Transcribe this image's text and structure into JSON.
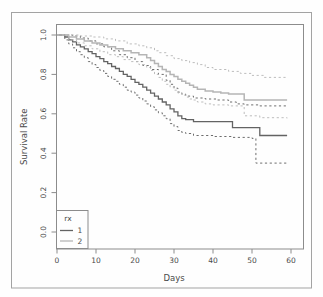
{
  "figure": {
    "border_color": "#a3a3a3",
    "panel_border_color": "#8c8c8c",
    "background": "#fefefe"
  },
  "chart_data": {
    "type": "line",
    "subtype": "kaplan-meier-step-survival",
    "title": "",
    "xlabel": "Days",
    "ylabel": "Survival Rate",
    "xlim": [
      0,
      60
    ],
    "ylim": [
      0.0,
      1.0
    ],
    "x_ticks": [
      0,
      10,
      20,
      30,
      40,
      50,
      60
    ],
    "y_ticks": [
      "0.0",
      "0.2",
      "0.4",
      "0.6",
      "0.8",
      "1.0"
    ],
    "grid": false,
    "legend": {
      "title": "rx",
      "position": "bottom-left",
      "entries": [
        {
          "label": "1",
          "color": "#636363"
        },
        {
          "label": "2",
          "color": "#b5b5b5"
        }
      ]
    },
    "series": [
      {
        "name": "rx=1 estimate",
        "group": "1",
        "style": "solid",
        "color": "#636363",
        "width": 1.3,
        "points": [
          [
            0,
            1.0
          ],
          [
            2,
            0.99
          ],
          [
            3,
            0.975
          ],
          [
            4,
            0.965
          ],
          [
            5,
            0.95
          ],
          [
            6,
            0.94
          ],
          [
            7,
            0.93
          ],
          [
            8,
            0.915
          ],
          [
            9,
            0.905
          ],
          [
            10,
            0.89
          ],
          [
            11,
            0.88
          ],
          [
            12,
            0.865
          ],
          [
            13,
            0.855
          ],
          [
            14,
            0.84
          ],
          [
            15,
            0.83
          ],
          [
            16,
            0.815
          ],
          [
            17,
            0.8
          ],
          [
            18,
            0.79
          ],
          [
            19,
            0.775
          ],
          [
            20,
            0.76
          ],
          [
            21,
            0.75
          ],
          [
            22,
            0.735
          ],
          [
            23,
            0.72
          ],
          [
            24,
            0.705
          ],
          [
            25,
            0.69
          ],
          [
            26,
            0.675
          ],
          [
            27,
            0.66
          ],
          [
            28,
            0.645
          ],
          [
            29,
            0.625
          ],
          [
            30,
            0.61
          ],
          [
            31,
            0.59
          ],
          [
            32,
            0.575
          ],
          [
            33,
            0.57
          ],
          [
            35,
            0.56
          ],
          [
            45,
            0.53
          ],
          [
            52,
            0.49
          ],
          [
            59,
            0.49
          ]
        ]
      },
      {
        "name": "rx=1 upper 95% CI",
        "group": "1",
        "style": "dashed",
        "color": "#6d6d6d",
        "width": 1.0,
        "points": [
          [
            0,
            1.0
          ],
          [
            4,
            0.995
          ],
          [
            6,
            0.985
          ],
          [
            8,
            0.97
          ],
          [
            10,
            0.955
          ],
          [
            12,
            0.94
          ],
          [
            14,
            0.92
          ],
          [
            16,
            0.9
          ],
          [
            18,
            0.885
          ],
          [
            20,
            0.865
          ],
          [
            22,
            0.845
          ],
          [
            24,
            0.825
          ],
          [
            26,
            0.8
          ],
          [
            28,
            0.77
          ],
          [
            29,
            0.75
          ],
          [
            30,
            0.73
          ],
          [
            31,
            0.71
          ],
          [
            32,
            0.7
          ],
          [
            33,
            0.69
          ],
          [
            35,
            0.68
          ],
          [
            38,
            0.675
          ],
          [
            41,
            0.67
          ],
          [
            44,
            0.66
          ],
          [
            46,
            0.65
          ],
          [
            48,
            0.645
          ],
          [
            52,
            0.64
          ],
          [
            59,
            0.64
          ]
        ]
      },
      {
        "name": "rx=1 lower 95% CI",
        "group": "1",
        "style": "dashed",
        "color": "#6d6d6d",
        "width": 1.0,
        "points": [
          [
            0,
            1.0
          ],
          [
            2,
            0.975
          ],
          [
            3,
            0.955
          ],
          [
            4,
            0.935
          ],
          [
            5,
            0.915
          ],
          [
            6,
            0.9
          ],
          [
            7,
            0.885
          ],
          [
            8,
            0.865
          ],
          [
            9,
            0.85
          ],
          [
            10,
            0.835
          ],
          [
            11,
            0.82
          ],
          [
            12,
            0.805
          ],
          [
            13,
            0.79
          ],
          [
            14,
            0.775
          ],
          [
            15,
            0.765
          ],
          [
            16,
            0.75
          ],
          [
            17,
            0.735
          ],
          [
            18,
            0.72
          ],
          [
            19,
            0.71
          ],
          [
            20,
            0.695
          ],
          [
            21,
            0.68
          ],
          [
            22,
            0.665
          ],
          [
            23,
            0.65
          ],
          [
            24,
            0.635
          ],
          [
            25,
            0.62
          ],
          [
            26,
            0.605
          ],
          [
            27,
            0.59
          ],
          [
            28,
            0.575
          ],
          [
            29,
            0.55
          ],
          [
            30,
            0.535
          ],
          [
            31,
            0.515
          ],
          [
            32,
            0.505
          ],
          [
            33,
            0.5
          ],
          [
            35,
            0.49
          ],
          [
            40,
            0.485
          ],
          [
            45,
            0.48
          ],
          [
            50,
            0.475
          ],
          [
            51,
            0.35
          ],
          [
            59,
            0.35
          ]
        ]
      },
      {
        "name": "rx=2 estimate",
        "group": "2",
        "style": "solid",
        "color": "#b5b5b5",
        "width": 1.5,
        "points": [
          [
            0,
            1.0
          ],
          [
            3,
            0.99
          ],
          [
            5,
            0.98
          ],
          [
            7,
            0.97
          ],
          [
            9,
            0.96
          ],
          [
            11,
            0.95
          ],
          [
            13,
            0.94
          ],
          [
            15,
            0.93
          ],
          [
            17,
            0.92
          ],
          [
            19,
            0.91
          ],
          [
            21,
            0.9
          ],
          [
            23,
            0.885
          ],
          [
            24,
            0.87
          ],
          [
            25,
            0.855
          ],
          [
            26,
            0.84
          ],
          [
            27,
            0.825
          ],
          [
            28,
            0.815
          ],
          [
            29,
            0.8
          ],
          [
            30,
            0.79
          ],
          [
            31,
            0.775
          ],
          [
            32,
            0.765
          ],
          [
            33,
            0.755
          ],
          [
            34,
            0.745
          ],
          [
            35,
            0.735
          ],
          [
            36,
            0.725
          ],
          [
            38,
            0.715
          ],
          [
            40,
            0.71
          ],
          [
            42,
            0.705
          ],
          [
            44,
            0.7
          ],
          [
            48,
            0.67
          ],
          [
            59,
            0.67
          ]
        ]
      },
      {
        "name": "rx=2 upper 95% CI",
        "group": "2",
        "style": "dashed",
        "color": "#bdbdbd",
        "width": 1.0,
        "points": [
          [
            0,
            1.0
          ],
          [
            6,
            0.995
          ],
          [
            9,
            0.99
          ],
          [
            12,
            0.98
          ],
          [
            15,
            0.97
          ],
          [
            18,
            0.955
          ],
          [
            21,
            0.945
          ],
          [
            23,
            0.935
          ],
          [
            25,
            0.92
          ],
          [
            26,
            0.91
          ],
          [
            28,
            0.895
          ],
          [
            30,
            0.88
          ],
          [
            32,
            0.87
          ],
          [
            34,
            0.86
          ],
          [
            36,
            0.85
          ],
          [
            38,
            0.835
          ],
          [
            40,
            0.825
          ],
          [
            44,
            0.815
          ],
          [
            47,
            0.805
          ],
          [
            50,
            0.795
          ],
          [
            53,
            0.785
          ],
          [
            59,
            0.78
          ]
        ]
      },
      {
        "name": "rx=2 lower 95% CI",
        "group": "2",
        "style": "dashed",
        "color": "#bdbdbd",
        "width": 1.0,
        "points": [
          [
            0,
            1.0
          ],
          [
            3,
            0.975
          ],
          [
            5,
            0.96
          ],
          [
            7,
            0.945
          ],
          [
            9,
            0.93
          ],
          [
            11,
            0.915
          ],
          [
            13,
            0.9
          ],
          [
            15,
            0.89
          ],
          [
            17,
            0.875
          ],
          [
            19,
            0.865
          ],
          [
            21,
            0.85
          ],
          [
            23,
            0.835
          ],
          [
            24,
            0.82
          ],
          [
            25,
            0.8
          ],
          [
            26,
            0.785
          ],
          [
            27,
            0.765
          ],
          [
            28,
            0.75
          ],
          [
            29,
            0.735
          ],
          [
            30,
            0.72
          ],
          [
            31,
            0.705
          ],
          [
            32,
            0.695
          ],
          [
            33,
            0.685
          ],
          [
            34,
            0.675
          ],
          [
            35,
            0.67
          ],
          [
            36,
            0.66
          ],
          [
            38,
            0.65
          ],
          [
            40,
            0.645
          ],
          [
            44,
            0.64
          ],
          [
            48,
            0.59
          ],
          [
            52,
            0.58
          ],
          [
            59,
            0.577
          ]
        ]
      }
    ]
  }
}
